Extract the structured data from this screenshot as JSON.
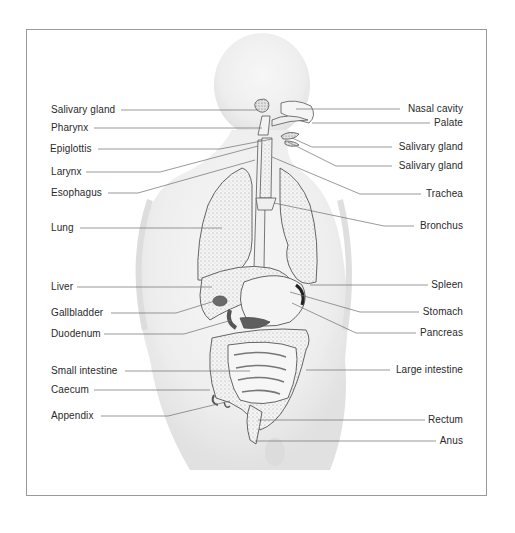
{
  "diagram": {
    "left_labels": [
      {
        "text": "Salivary gland",
        "x": 51,
        "y": 104,
        "line_from": [
          121,
          110
        ],
        "line_to": [
          258,
          110
        ]
      },
      {
        "text": "Pharynx",
        "x": 51,
        "y": 122,
        "line_from": [
          94,
          128
        ],
        "line_to": [
          262,
          128
        ]
      },
      {
        "text": "Epiglottis",
        "x": 50,
        "y": 143,
        "line_from": [
          98,
          149
        ],
        "line_to": [
          220,
          149
        ],
        "bend_to": [
          272,
          139
        ]
      },
      {
        "text": "Larynx",
        "x": 51,
        "y": 166,
        "line_from": [
          86,
          172
        ],
        "line_to": [
          160,
          172
        ],
        "bend_to": [
          258,
          146
        ]
      },
      {
        "text": "Esophagus",
        "x": 51,
        "y": 187,
        "line_from": [
          108,
          193
        ],
        "line_to": [
          138,
          193
        ],
        "bend_to": [
          255,
          160
        ]
      },
      {
        "text": "Lung",
        "x": 51,
        "y": 222,
        "line_from": [
          80,
          228
        ],
        "line_to": [
          222,
          228
        ]
      },
      {
        "text": "Liver",
        "x": 51,
        "y": 281,
        "line_from": [
          77,
          287
        ],
        "line_to": [
          212,
          287
        ]
      },
      {
        "text": "Gallbladder",
        "x": 51,
        "y": 307,
        "line_from": [
          111,
          313
        ],
        "line_to": [
          176,
          313
        ],
        "bend_to": [
          218,
          300
        ]
      },
      {
        "text": "Duodenum",
        "x": 51,
        "y": 328,
        "line_from": [
          104,
          334
        ],
        "line_to": [
          184,
          334
        ],
        "bend_to": [
          232,
          320
        ]
      },
      {
        "text": "Small intestine",
        "x": 51,
        "y": 365,
        "line_from": [
          125,
          371
        ],
        "line_to": [
          250,
          371
        ]
      },
      {
        "text": "Caecum",
        "x": 51,
        "y": 384,
        "line_from": [
          94,
          390
        ],
        "line_to": [
          210,
          390
        ]
      },
      {
        "text": "Appendix",
        "x": 51,
        "y": 410,
        "line_from": [
          101,
          416
        ],
        "line_to": [
          168,
          416
        ],
        "bend_to": [
          230,
          401
        ]
      }
    ],
    "right_labels": [
      {
        "text": "Nasal cavity",
        "x": 463,
        "y": 103,
        "line_from": [
          400,
          109
        ],
        "line_to": [
          296,
          109
        ]
      },
      {
        "text": "Palate",
        "x": 463,
        "y": 117,
        "line_from": [
          430,
          123
        ],
        "line_to": [
          312,
          123
        ]
      },
      {
        "text": "Salivary gland",
        "x": 463,
        "y": 141,
        "line_from": [
          392,
          147
        ],
        "line_to": [
          312,
          147
        ],
        "bend_to": [
          292,
          138
        ]
      },
      {
        "text": "Salivary gland",
        "x": 463,
        "y": 160,
        "line_from": [
          392,
          166
        ],
        "line_to": [
          336,
          166
        ],
        "bend_to": [
          288,
          142
        ]
      },
      {
        "text": "Trachea",
        "x": 463,
        "y": 188,
        "line_from": [
          421,
          194
        ],
        "line_to": [
          360,
          194
        ],
        "bend_to": [
          272,
          157
        ]
      },
      {
        "text": "Bronchus",
        "x": 463,
        "y": 220,
        "line_from": [
          414,
          226
        ],
        "line_to": [
          384,
          226
        ],
        "bend_to": [
          274,
          203
        ]
      },
      {
        "text": "Spleen",
        "x": 463,
        "y": 279,
        "line_from": [
          428,
          285
        ],
        "line_to": [
          310,
          285
        ]
      },
      {
        "text": "Stomach",
        "x": 463,
        "y": 306,
        "line_from": [
          419,
          312
        ],
        "line_to": [
          360,
          312
        ],
        "bend_to": [
          290,
          292
        ]
      },
      {
        "text": "Pancreas",
        "x": 463,
        "y": 327,
        "line_from": [
          416,
          333
        ],
        "line_to": [
          356,
          333
        ],
        "bend_to": [
          292,
          303
        ]
      },
      {
        "text": "Large intestine",
        "x": 463,
        "y": 364,
        "line_from": [
          390,
          370
        ],
        "line_to": [
          306,
          370
        ]
      },
      {
        "text": "Rectum",
        "x": 463,
        "y": 414,
        "line_from": [
          425,
          420
        ],
        "line_to": [
          258,
          420
        ]
      },
      {
        "text": "Anus",
        "x": 463,
        "y": 435,
        "line_from": [
          436,
          441
        ],
        "line_to": [
          255,
          441
        ]
      }
    ],
    "colors": {
      "text": "#2a2a2a",
      "leader_line": "#6e6e6e",
      "frame": "#9a9a9a",
      "body_shade": "#e6e6e6",
      "organ_outline": "#555555"
    }
  }
}
